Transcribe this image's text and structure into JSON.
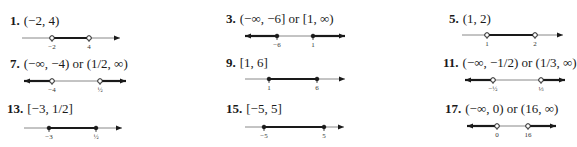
{
  "problems": [
    {
      "number": "1.",
      "answer": "(−2, 4)",
      "line": {
        "x0": 22,
        "x1": 120,
        "y": 38,
        "arrows": "right",
        "segments": [
          {
            "from": 52,
            "to": 89,
            "bold": true
          }
        ],
        "points": [
          {
            "x": 52,
            "label": "−2",
            "open": true
          },
          {
            "x": 89,
            "label": "4",
            "open": true
          }
        ]
      },
      "pos": {
        "hx": 10,
        "hy": 13
      }
    },
    {
      "number": "3.",
      "answer": "(−∞, −6] or [1, ∞)",
      "line": {
        "x0": 245,
        "x1": 345,
        "y": 36,
        "arrows": "both",
        "segments": [
          {
            "from": 245,
            "to": 277,
            "bold": true
          },
          {
            "from": 313,
            "to": 345,
            "bold": true
          }
        ],
        "points": [
          {
            "x": 277,
            "label": "−6",
            "open": false
          },
          {
            "x": 313,
            "label": "1",
            "open": false
          }
        ]
      },
      "pos": {
        "hx": 226,
        "hy": 11
      }
    },
    {
      "number": "5.",
      "answer": "(1, 2)",
      "line": {
        "x0": 462,
        "x1": 563,
        "y": 35,
        "arrows": "right",
        "segments": [
          {
            "from": 487,
            "to": 535,
            "bold": true
          }
        ],
        "points": [
          {
            "x": 487,
            "label": "1",
            "open": true
          },
          {
            "x": 535,
            "label": "2",
            "open": true
          }
        ]
      },
      "pos": {
        "hx": 449,
        "hy": 11
      }
    },
    {
      "number": "7.",
      "answer": "(−∞, −4) or (1/2, ∞)",
      "line": {
        "x0": 24,
        "x1": 126,
        "y": 81,
        "arrows": "both",
        "segments": [
          {
            "from": 24,
            "to": 52,
            "bold": true
          },
          {
            "from": 100,
            "to": 126,
            "bold": true
          }
        ],
        "points": [
          {
            "x": 52,
            "label": "−4",
            "open": true
          },
          {
            "x": 100,
            "label": "½",
            "open": true
          }
        ]
      },
      "pos": {
        "hx": 10,
        "hy": 56
      }
    },
    {
      "number": "9.",
      "answer": "[1, 6]",
      "line": {
        "x0": 245,
        "x1": 345,
        "y": 79,
        "arrows": "right",
        "segments": [
          {
            "from": 269,
            "to": 317,
            "bold": true
          }
        ],
        "points": [
          {
            "x": 269,
            "label": "1",
            "open": false
          },
          {
            "x": 317,
            "label": "6",
            "open": false
          }
        ]
      },
      "pos": {
        "hx": 226,
        "hy": 55
      }
    },
    {
      "number": "11.",
      "answer": "(−∞, −1/2) or (1/3, ∞)",
      "line": {
        "x0": 465,
        "x1": 565,
        "y": 80,
        "arrows": "both",
        "segments": [
          {
            "from": 465,
            "to": 493,
            "bold": true
          },
          {
            "from": 541,
            "to": 565,
            "bold": true
          }
        ],
        "points": [
          {
            "x": 493,
            "label": "−½",
            "open": true
          },
          {
            "x": 541,
            "label": "⅓",
            "open": true
          }
        ]
      },
      "pos": {
        "hx": 443,
        "hy": 55
      }
    },
    {
      "number": "13.",
      "answer": "[−3, 1/2]",
      "line": {
        "x0": 24,
        "x1": 122,
        "y": 128,
        "arrows": "right",
        "segments": [
          {
            "from": 49,
            "to": 96,
            "bold": true
          }
        ],
        "points": [
          {
            "x": 49,
            "label": "−3",
            "open": false
          },
          {
            "x": 96,
            "label": "½",
            "open": false
          }
        ]
      },
      "pos": {
        "hx": 7,
        "hy": 101
      }
    },
    {
      "number": "15.",
      "answer": "[−5, 5]",
      "line": {
        "x0": 245,
        "x1": 344,
        "y": 127,
        "arrows": "right",
        "segments": [
          {
            "from": 264,
            "to": 324,
            "bold": true
          }
        ],
        "points": [
          {
            "x": 264,
            "label": "−5",
            "open": false
          },
          {
            "x": 324,
            "label": "5",
            "open": false
          }
        ]
      },
      "pos": {
        "hx": 226,
        "hy": 101
      }
    },
    {
      "number": "17.",
      "answer": "(−∞, 0) or (16, ∞)",
      "line": {
        "x0": 467,
        "x1": 556,
        "y": 126,
        "arrows": "both",
        "segments": [
          {
            "from": 467,
            "to": 497,
            "bold": true
          },
          {
            "from": 528,
            "to": 556,
            "bold": true
          }
        ],
        "points": [
          {
            "x": 497,
            "label": "0",
            "open": true
          },
          {
            "x": 528,
            "label": "16",
            "open": true
          }
        ]
      },
      "pos": {
        "hx": 445,
        "hy": 101
      }
    }
  ],
  "colors": {
    "ink": "#1a1a1a",
    "thin_line": "#888888"
  }
}
